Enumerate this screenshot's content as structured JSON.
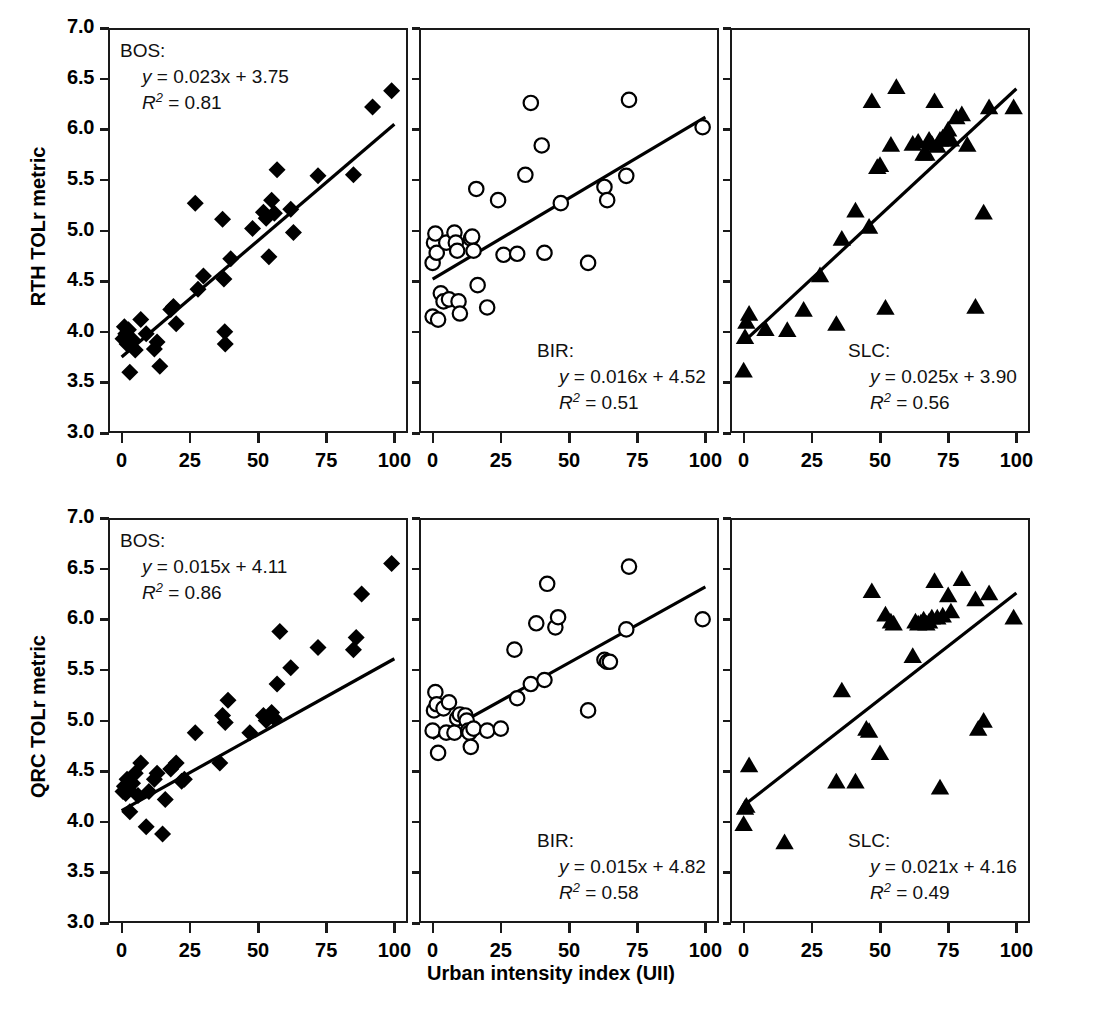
{
  "figure": {
    "xlabel": "Urban intensity index (UII)",
    "ylabel_row1": "RTH TOLr metric",
    "ylabel_row2": "QRC TOLr metric",
    "xticks": [
      "0",
      "25",
      "50",
      "75",
      "100"
    ],
    "yticks": [
      "3.0",
      "3.5",
      "4.0",
      "4.5",
      "5.0",
      "5.5",
      "6.0",
      "6.5",
      "7.0"
    ],
    "xlim": [
      -5,
      105
    ],
    "ylim": [
      3.0,
      7.0
    ],
    "line_color": "#000000",
    "axis_color": "#1a1a1a"
  },
  "chart_data": [
    {
      "type": "scatter",
      "panel": "r1c1",
      "site": "BOS:",
      "equation": "y = 0.023x + 3.75",
      "r2": "R2 = 0.81",
      "r2_value": 0.81,
      "slope": 0.023,
      "intercept": 3.75,
      "marker": "filled-diamond",
      "xlabel": "Urban intensity index (UII)",
      "ylabel": "RTH TOLr metric",
      "xlim": [
        -5,
        105
      ],
      "ylim": [
        3.0,
        7.0
      ],
      "grid": false,
      "points": [
        [
          0.5,
          3.93
        ],
        [
          1.0,
          4.05
        ],
        [
          1.5,
          3.98
        ],
        [
          2.0,
          3.88
        ],
        [
          2.5,
          4.02
        ],
        [
          3.0,
          3.6
        ],
        [
          4.0,
          3.92
        ],
        [
          5.0,
          3.82
        ],
        [
          7.0,
          4.12
        ],
        [
          9.0,
          3.98
        ],
        [
          12.0,
          3.83
        ],
        [
          13.0,
          3.9
        ],
        [
          14.0,
          3.66
        ],
        [
          18.0,
          4.22
        ],
        [
          19.0,
          4.25
        ],
        [
          20.0,
          4.08
        ],
        [
          27.0,
          5.27
        ],
        [
          28.0,
          4.42
        ],
        [
          30.0,
          4.55
        ],
        [
          37.0,
          5.11
        ],
        [
          37.5,
          4.52
        ],
        [
          37.8,
          4.0
        ],
        [
          38.0,
          3.88
        ],
        [
          40.0,
          4.72
        ],
        [
          48.0,
          5.02
        ],
        [
          52.0,
          5.18
        ],
        [
          53.0,
          5.12
        ],
        [
          54.0,
          4.74
        ],
        [
          55.0,
          5.3
        ],
        [
          56.0,
          5.17
        ],
        [
          57.0,
          5.6
        ],
        [
          62.0,
          5.21
        ],
        [
          63.0,
          4.98
        ],
        [
          72.0,
          5.54
        ],
        [
          85.0,
          5.55
        ],
        [
          92.0,
          6.22
        ],
        [
          99.0,
          6.38
        ]
      ]
    },
    {
      "type": "scatter",
      "panel": "r1c2",
      "site": "BIR:",
      "equation": "y = 0.016x + 4.52",
      "r2": "R2 = 0.51",
      "r2_value": 0.51,
      "slope": 0.016,
      "intercept": 4.52,
      "marker": "open-circle",
      "xlabel": "Urban intensity index (UII)",
      "ylabel": "RTH TOLr metric",
      "xlim": [
        -5,
        105
      ],
      "ylim": [
        3.0,
        7.0
      ],
      "grid": false,
      "points": [
        [
          0.0,
          4.15
        ],
        [
          0.0,
          4.68
        ],
        [
          0.5,
          4.88
        ],
        [
          1.0,
          4.97
        ],
        [
          1.5,
          4.78
        ],
        [
          2.0,
          4.12
        ],
        [
          3.0,
          4.38
        ],
        [
          4.0,
          4.3
        ],
        [
          5.0,
          4.88
        ],
        [
          6.0,
          4.32
        ],
        [
          8.0,
          4.98
        ],
        [
          8.5,
          4.88
        ],
        [
          9.0,
          4.8
        ],
        [
          9.5,
          4.3
        ],
        [
          10.0,
          4.18
        ],
        [
          14.0,
          4.92
        ],
        [
          14.5,
          4.94
        ],
        [
          15.0,
          4.8
        ],
        [
          16.0,
          5.41
        ],
        [
          16.5,
          4.46
        ],
        [
          20.0,
          4.24
        ],
        [
          24.0,
          5.3
        ],
        [
          26.0,
          4.76
        ],
        [
          31.0,
          4.77
        ],
        [
          34.0,
          5.55
        ],
        [
          36.0,
          6.26
        ],
        [
          40.0,
          5.84
        ],
        [
          41.0,
          4.78
        ],
        [
          47.0,
          5.27
        ],
        [
          57.0,
          4.68
        ],
        [
          63.0,
          5.43
        ],
        [
          64.0,
          5.3
        ],
        [
          71.0,
          5.54
        ],
        [
          72.0,
          6.29
        ],
        [
          99.0,
          6.02
        ]
      ]
    },
    {
      "type": "scatter",
      "panel": "r1c3",
      "site": "SLC:",
      "equation": "y = 0.025x + 3.90",
      "r2": "R2 = 0.56",
      "r2_value": 0.56,
      "slope": 0.025,
      "intercept": 3.9,
      "marker": "filled-triangle",
      "xlabel": "Urban intensity index (UII)",
      "ylabel": "RTH TOLr metric",
      "xlim": [
        -5,
        105
      ],
      "ylim": [
        3.0,
        7.0
      ],
      "grid": false,
      "points": [
        [
          0.0,
          3.62
        ],
        [
          0.5,
          3.95
        ],
        [
          1.0,
          4.1
        ],
        [
          2.0,
          4.18
        ],
        [
          8.0,
          4.03
        ],
        [
          16.0,
          4.02
        ],
        [
          22.0,
          4.22
        ],
        [
          28.0,
          4.56
        ],
        [
          34.0,
          4.08
        ],
        [
          36.0,
          4.92
        ],
        [
          41.0,
          5.2
        ],
        [
          46.0,
          5.04
        ],
        [
          47.0,
          6.28
        ],
        [
          49.0,
          5.63
        ],
        [
          50.0,
          5.65
        ],
        [
          52.0,
          4.24
        ],
        [
          54.0,
          5.85
        ],
        [
          56.0,
          6.42
        ],
        [
          62.0,
          5.86
        ],
        [
          64.0,
          5.88
        ],
        [
          66.0,
          5.76
        ],
        [
          67.0,
          5.76
        ],
        [
          68.0,
          5.9
        ],
        [
          69.0,
          5.86
        ],
        [
          70.0,
          6.28
        ],
        [
          71.0,
          5.84
        ],
        [
          72.0,
          5.9
        ],
        [
          73.0,
          5.92
        ],
        [
          74.0,
          5.9
        ],
        [
          75.0,
          6.0
        ],
        [
          76.0,
          5.9
        ],
        [
          78.0,
          6.12
        ],
        [
          80.0,
          6.15
        ],
        [
          82.0,
          5.85
        ],
        [
          85.0,
          4.25
        ],
        [
          88.0,
          5.18
        ],
        [
          90.0,
          6.22
        ],
        [
          99.0,
          6.22
        ]
      ]
    },
    {
      "type": "scatter",
      "panel": "r2c1",
      "site": "BOS:",
      "equation": "y = 0.015x + 4.11",
      "r2": "R2 = 0.86",
      "r2_value": 0.86,
      "slope": 0.015,
      "intercept": 4.11,
      "marker": "filled-diamond",
      "xlabel": "Urban intensity index (UII)",
      "ylabel": "QRC TOLr metric",
      "xlim": [
        -5,
        105
      ],
      "ylim": [
        3.0,
        7.0
      ],
      "grid": false,
      "points": [
        [
          0.5,
          4.3
        ],
        [
          1.0,
          4.35
        ],
        [
          1.5,
          4.28
        ],
        [
          2.0,
          4.42
        ],
        [
          2.5,
          4.32
        ],
        [
          3.0,
          4.1
        ],
        [
          4.0,
          4.38
        ],
        [
          5.0,
          4.48
        ],
        [
          6.0,
          4.26
        ],
        [
          7.0,
          4.58
        ],
        [
          9.0,
          3.95
        ],
        [
          10.0,
          4.3
        ],
        [
          12.0,
          4.42
        ],
        [
          13.0,
          4.48
        ],
        [
          15.0,
          3.88
        ],
        [
          16.0,
          4.22
        ],
        [
          18.0,
          4.52
        ],
        [
          20.0,
          4.58
        ],
        [
          22.0,
          4.4
        ],
        [
          23.0,
          4.42
        ],
        [
          27.0,
          4.88
        ],
        [
          36.0,
          4.58
        ],
        [
          37.0,
          5.05
        ],
        [
          38.0,
          4.98
        ],
        [
          39.0,
          5.2
        ],
        [
          47.0,
          4.88
        ],
        [
          52.0,
          5.05
        ],
        [
          53.0,
          5.0
        ],
        [
          55.0,
          5.08
        ],
        [
          56.0,
          5.02
        ],
        [
          57.0,
          5.36
        ],
        [
          58.0,
          5.88
        ],
        [
          62.0,
          5.52
        ],
        [
          72.0,
          5.72
        ],
        [
          85.0,
          5.7
        ],
        [
          86.0,
          5.82
        ],
        [
          88.0,
          6.25
        ],
        [
          99.0,
          6.55
        ]
      ]
    },
    {
      "type": "scatter",
      "panel": "r2c2",
      "site": "BIR:",
      "equation": "y = 0.015x + 4.82",
      "r2": "R2 = 0.58",
      "r2_value": 0.58,
      "slope": 0.015,
      "intercept": 4.82,
      "marker": "open-circle",
      "xlabel": "Urban intensity index (UII)",
      "ylabel": "QRC TOLr metric",
      "xlim": [
        -5,
        105
      ],
      "ylim": [
        3.0,
        7.0
      ],
      "grid": false,
      "points": [
        [
          0.0,
          4.9
        ],
        [
          0.5,
          5.1
        ],
        [
          1.0,
          5.28
        ],
        [
          1.5,
          5.16
        ],
        [
          2.0,
          4.68
        ],
        [
          4.0,
          5.12
        ],
        [
          5.0,
          4.88
        ],
        [
          6.0,
          5.18
        ],
        [
          8.0,
          4.88
        ],
        [
          9.0,
          5.02
        ],
        [
          10.0,
          5.06
        ],
        [
          12.0,
          5.05
        ],
        [
          12.5,
          5.0
        ],
        [
          13.0,
          4.9
        ],
        [
          13.5,
          4.88
        ],
        [
          14.0,
          4.74
        ],
        [
          15.0,
          4.92
        ],
        [
          20.0,
          4.9
        ],
        [
          25.0,
          4.92
        ],
        [
          30.0,
          5.7
        ],
        [
          31.0,
          5.22
        ],
        [
          36.0,
          5.36
        ],
        [
          38.0,
          5.96
        ],
        [
          41.0,
          5.4
        ],
        [
          42.0,
          6.35
        ],
        [
          45.0,
          5.92
        ],
        [
          46.0,
          6.02
        ],
        [
          57.0,
          5.1
        ],
        [
          63.0,
          5.6
        ],
        [
          64.0,
          5.58
        ],
        [
          65.0,
          5.58
        ],
        [
          71.0,
          5.9
        ],
        [
          72.0,
          6.52
        ],
        [
          99.0,
          6.0
        ]
      ]
    },
    {
      "type": "scatter",
      "panel": "r2c3",
      "site": "SLC:",
      "equation": "y = 0.021x + 4.16",
      "r2": "R2 = 0.49",
      "r2_value": 0.49,
      "slope": 0.021,
      "intercept": 4.16,
      "marker": "filled-triangle",
      "xlabel": "Urban intensity index (UII)",
      "ylabel": "QRC TOLr metric",
      "xlim": [
        -5,
        105
      ],
      "ylim": [
        3.0,
        7.0
      ],
      "grid": false,
      "points": [
        [
          0.0,
          3.98
        ],
        [
          0.5,
          4.14
        ],
        [
          1.0,
          4.16
        ],
        [
          2.0,
          4.56
        ],
        [
          15.0,
          3.8
        ],
        [
          34.0,
          4.4
        ],
        [
          36.0,
          5.3
        ],
        [
          41.0,
          4.4
        ],
        [
          45.0,
          4.92
        ],
        [
          46.0,
          4.9
        ],
        [
          47.0,
          6.28
        ],
        [
          50.0,
          4.68
        ],
        [
          52.0,
          6.05
        ],
        [
          54.0,
          5.98
        ],
        [
          55.0,
          5.96
        ],
        [
          62.0,
          5.64
        ],
        [
          63.0,
          5.98
        ],
        [
          64.0,
          5.96
        ],
        [
          65.0,
          5.97
        ],
        [
          66.0,
          6.0
        ],
        [
          67.0,
          5.96
        ],
        [
          68.0,
          5.98
        ],
        [
          69.0,
          6.02
        ],
        [
          70.0,
          6.38
        ],
        [
          71.0,
          6.02
        ],
        [
          72.0,
          4.34
        ],
        [
          73.0,
          6.04
        ],
        [
          75.0,
          6.24
        ],
        [
          76.0,
          6.08
        ],
        [
          80.0,
          6.4
        ],
        [
          85.0,
          6.2
        ],
        [
          86.0,
          4.92
        ],
        [
          88.0,
          5.0
        ],
        [
          90.0,
          6.26
        ],
        [
          99.0,
          6.02
        ]
      ]
    }
  ]
}
